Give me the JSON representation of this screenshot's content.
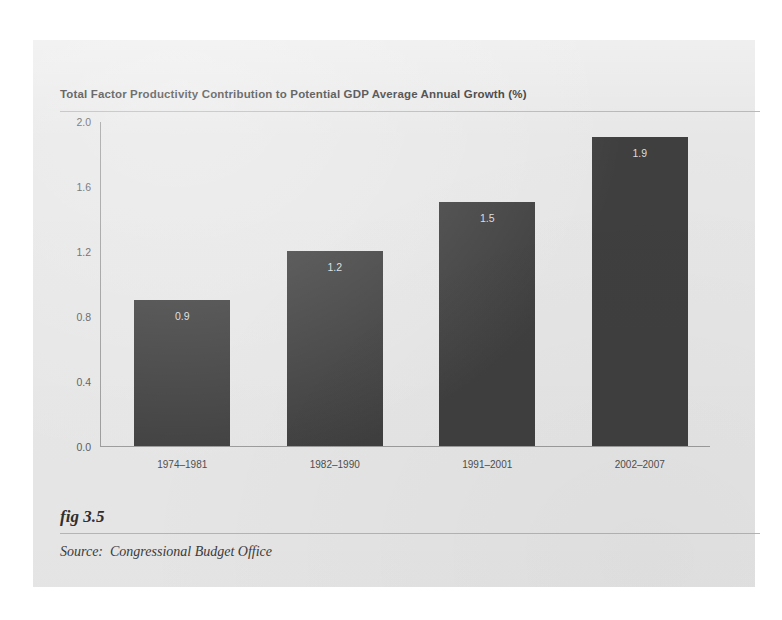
{
  "figure": {
    "number_label": "fig 3.5",
    "source_label": "Source:",
    "source_text": "Congressional Budget Office",
    "card_bg": "#e7e7e7",
    "bar_color": "#3f3f3f",
    "axis_color": "#9b9b9b"
  },
  "chart_data": {
    "type": "bar",
    "title": "Total Factor Productivity Contribution to Potential GDP Average Annual Growth (%)",
    "xlabel": "",
    "ylabel": "",
    "categories": [
      "1974–1981",
      "1982–1990",
      "1991–2001",
      "2002–2007"
    ],
    "values": [
      0.9,
      1.2,
      1.5,
      1.9
    ],
    "data_labels": [
      "0.9",
      "1.2",
      "1.5",
      "1.9"
    ],
    "ylim": [
      0.0,
      2.0
    ],
    "yticks": [
      0.0,
      0.4,
      0.8,
      1.2,
      1.6,
      2.0
    ],
    "ytick_labels": [
      "0.0",
      "0.4",
      "0.8",
      "1.2",
      "1.6",
      "2.0"
    ],
    "grid": false,
    "legend": false,
    "series": [
      {
        "name": "Total factor productivity contribution",
        "values": [
          0.9,
          1.2,
          1.5,
          1.9
        ]
      }
    ]
  }
}
